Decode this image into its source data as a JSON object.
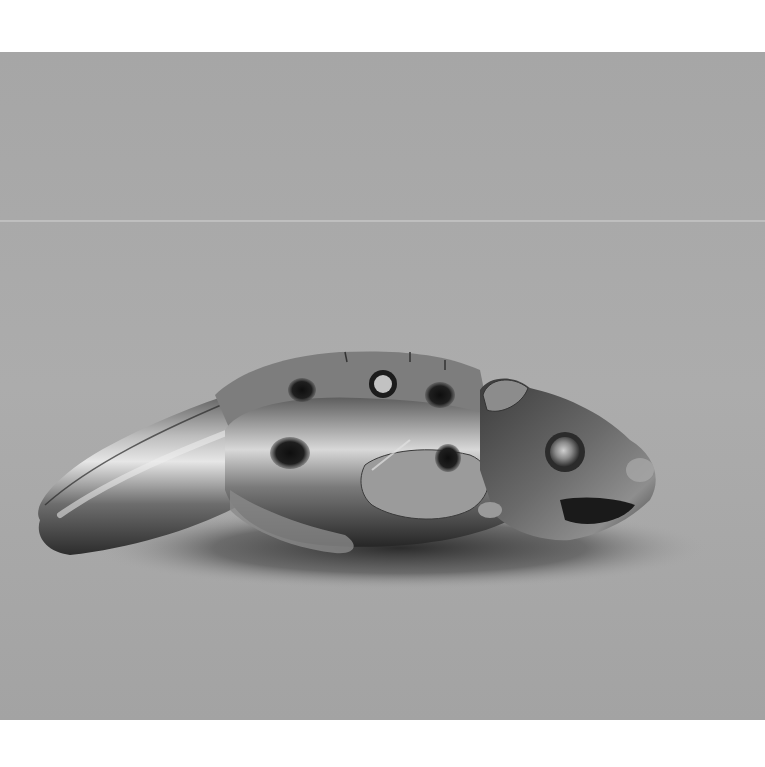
{
  "image": {
    "kind": "photograph",
    "mode": "grayscale",
    "subject": "carved claw-shaped amulet with animal head",
    "background_color": "#a9a9a9",
    "margin_color": "#ffffff",
    "photo_bounds": {
      "top": 52,
      "bottom": 720,
      "left": 0,
      "right": 765
    },
    "seam_y": 221,
    "features": [
      {
        "name": "claw-tip",
        "position": "left"
      },
      {
        "name": "animal-head",
        "position": "right"
      },
      {
        "name": "perforation-hole",
        "position": "top-center"
      },
      {
        "name": "drilled-holes",
        "count": 4
      },
      {
        "name": "inlaid-eye",
        "position": "right"
      },
      {
        "name": "cast-shadow",
        "position": "below"
      }
    ]
  },
  "caption": "Carved claw amulet"
}
